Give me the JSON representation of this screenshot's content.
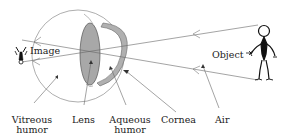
{
  "diagram": {
    "type": "eye-optics",
    "labels": {
      "image": "Image",
      "object": "Object",
      "vitreous_line1": "Vitreous",
      "vitreous_line2": "humor",
      "lens": "Lens",
      "aqueous_line1": "Aqueous",
      "aqueous_line2": "humor",
      "cornea": "Cornea",
      "air": "Air"
    },
    "colors": {
      "line": "#555555",
      "lens_fill": "#a8a8a8",
      "cornea_fill": "#b0b0b0",
      "figure": "#111111"
    }
  }
}
